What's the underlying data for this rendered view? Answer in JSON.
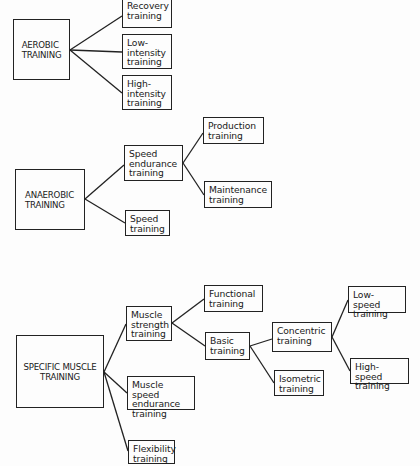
{
  "diagram": {
    "groups": [
      {
        "root": "AEROBIC\nTRAINING",
        "children": [
          {
            "label": "Recovery\ntraining"
          },
          {
            "label": "Low-\nintensity\ntraining"
          },
          {
            "label": "High-\nintensity\ntraining"
          }
        ]
      },
      {
        "root": "ANAEROBIC\nTRAINING",
        "children": [
          {
            "label": "Speed\nendurance\ntraining",
            "children": [
              {
                "label": "Production\ntraining"
              },
              {
                "label": "Maintenance\ntraining"
              }
            ]
          },
          {
            "label": "Speed\ntraining"
          }
        ]
      },
      {
        "root": "SPECIFIC MUSCLE\nTRAINING",
        "children": [
          {
            "label": "Muscle\nstrength\ntraining",
            "children": [
              {
                "label": "Functional\ntraining"
              },
              {
                "label": "Basic\ntraining",
                "children": [
                  {
                    "label": "Concentric\ntraining",
                    "children": [
                      {
                        "label": "Low-speed\ntraining"
                      },
                      {
                        "label": "High-speed\ntraining"
                      }
                    ]
                  },
                  {
                    "label": "Isometric\ntraining"
                  }
                ]
              }
            ]
          },
          {
            "label": "Muscle speed\nendurance\ntraining"
          },
          {
            "label": "Flexibility\ntraining"
          }
        ]
      }
    ]
  },
  "nodes": {
    "aerobic": "AEROBIC\nTRAINING",
    "recovery": "Recovery\ntraining",
    "low_intensity": "Low-\nintensity\ntraining",
    "high_intensity": "High-\nintensity\ntraining",
    "anaerobic": "ANAEROBIC\nTRAINING",
    "speed_endurance": "Speed\nendurance\ntraining",
    "production": "Production\ntraining",
    "maintenance": "Maintenance\ntraining",
    "speed": "Speed\ntraining",
    "specific_muscle": "SPECIFIC MUSCLE\nTRAINING",
    "muscle_strength": "Muscle\nstrength\ntraining",
    "functional": "Functional\ntraining",
    "basic": "Basic\ntraining",
    "concentric": "Concentric\ntraining",
    "low_speed": "Low-speed\ntraining",
    "high_speed": "High-speed\ntraining",
    "isometric": "Isometric\ntraining",
    "muscle_speed_endurance": "Muscle speed\nendurance\ntraining",
    "flexibility": "Flexibility\ntraining"
  },
  "colors": {
    "line": "#222222",
    "background": "#fdfdfd",
    "text": "#1a1a1a"
  }
}
